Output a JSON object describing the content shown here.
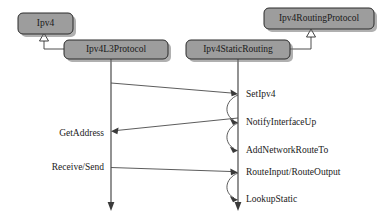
{
  "diagram": {
    "type": "uml-sequence-diagram",
    "background_color": "#ffffff",
    "box_fill_color": "#9d9d9d",
    "box_stroke_color": "#2b2b2b",
    "line_color": "#4a4a4a",
    "classes": [
      {
        "id": "ipv4",
        "label": "Ipv4",
        "x": 18,
        "y": 13,
        "w": 55,
        "h": 21,
        "has_lifeline": false
      },
      {
        "id": "ipv4routingprotocol",
        "label": "Ipv4RoutingProtocol",
        "x": 264,
        "y": 8,
        "w": 110,
        "h": 21,
        "has_lifeline": false
      },
      {
        "id": "ipv4l3protocol",
        "label": "Ipv4L3Protocol",
        "x": 64,
        "y": 40,
        "w": 104,
        "h": 19,
        "has_lifeline": true,
        "lifeline_x": 111
      },
      {
        "id": "ipv4staticrouting",
        "label": "Ipv4StaticRouting",
        "x": 186,
        "y": 40,
        "w": 104,
        "h": 19,
        "has_lifeline": true,
        "lifeline_x": 238
      }
    ],
    "generalizations": [
      {
        "from": "ipv4l3protocol",
        "to": "ipv4",
        "triangle_x": 44,
        "triangle_y": 34
      },
      {
        "from": "ipv4staticrouting",
        "to": "ipv4routingprotocol",
        "triangle_x": 311,
        "triangle_y": 29
      }
    ],
    "messages": [
      {
        "id": "m1",
        "label": "SetIpv4",
        "direction": "right",
        "from_x": 111,
        "from_y": 83,
        "to_x": 238,
        "to_y": 94,
        "label_x": 246,
        "label_y": 94
      },
      {
        "id": "m2",
        "label": "NotifyInterfaceUp",
        "direction": "self",
        "from_x": 238,
        "from_y": 94,
        "to_x": 238,
        "to_y": 122,
        "label_x": 246,
        "label_y": 122
      },
      {
        "id": "m3",
        "label": "GetAddress",
        "direction": "left",
        "from_x": 238,
        "from_y": 118,
        "to_x": 111,
        "to_y": 131,
        "label_x": 104,
        "label_y": 133
      },
      {
        "id": "m4",
        "label": "AddNetworkRouteTo",
        "direction": "self",
        "from_x": 238,
        "from_y": 122,
        "to_x": 238,
        "to_y": 150,
        "label_x": 246,
        "label_y": 150
      },
      {
        "id": "m5",
        "label": "Receive/Send",
        "direction": "right",
        "from_x": 111,
        "from_y": 167,
        "to_x": 238,
        "to_y": 172,
        "label_x": 104,
        "label_y": 167
      },
      {
        "id": "m6",
        "label": "RouteInput/RouteOutput",
        "direction": "label-only",
        "label_x": 246,
        "label_y": 172
      },
      {
        "id": "m7",
        "label": "LookupStatic",
        "direction": "self",
        "from_x": 238,
        "from_y": 172,
        "to_x": 238,
        "to_y": 199,
        "label_x": 246,
        "label_y": 199
      }
    ],
    "lifeline_bottom": 211
  }
}
